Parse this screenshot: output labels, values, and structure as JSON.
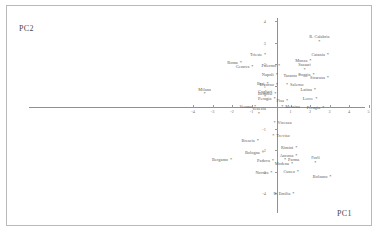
{
  "chart_data": {
    "type": "scatter",
    "title": "",
    "xlabel": "PC1",
    "ylabel": "PC2",
    "xlim": [
      -4.6,
      5.4
    ],
    "ylim": [
      -4.6,
      4.4
    ],
    "grid": false,
    "legend": "none",
    "marker": "*",
    "xticks": [
      -4,
      -3,
      -2,
      -1,
      1,
      2,
      3,
      4,
      5
    ],
    "yticks": [
      -4,
      -3,
      -2,
      -1,
      1,
      2,
      3,
      4
    ],
    "points": [
      {
        "label": "Milano",
        "x": -3.4,
        "y": 0.62,
        "pos": "above"
      },
      {
        "label": "Bergamo",
        "x": -2.05,
        "y": -2.45,
        "pos": "left"
      },
      {
        "label": "Roma",
        "x": -1.55,
        "y": 2.05,
        "pos": "left"
      },
      {
        "label": "Genova",
        "x": -0.95,
        "y": 1.9,
        "pos": "left"
      },
      {
        "label": "Trieste",
        "x": -0.3,
        "y": 2.45,
        "pos": "left"
      },
      {
        "label": "Palermo",
        "x": 0.42,
        "y": 1.92,
        "pos": "left"
      },
      {
        "label": "Napoli",
        "x": 0.3,
        "y": 1.52,
        "pos": "left"
      },
      {
        "label": "Verona",
        "x": -0.82,
        "y": 0.03,
        "pos": "left"
      },
      {
        "label": "Venezia",
        "x": -0.62,
        "y": -0.3,
        "pos": "above"
      },
      {
        "label": "Cagliari",
        "x": -0.3,
        "y": 0.5,
        "pos": "above"
      },
      {
        "label": "Brescia",
        "x": -0.68,
        "y": -1.55,
        "pos": "left"
      },
      {
        "label": "Bologna",
        "x": -0.42,
        "y": -2.12,
        "pos": "left"
      },
      {
        "label": "Padova",
        "x": 0.1,
        "y": -2.48,
        "pos": "left"
      },
      {
        "label": "Parma",
        "x": 0.72,
        "y": -2.45,
        "pos": "right"
      },
      {
        "label": "Messina",
        "x": 0.58,
        "y": 0.02,
        "pos": "right"
      },
      {
        "label": "Bari",
        "x": -0.18,
        "y": 1.1,
        "pos": "left"
      },
      {
        "label": "Livorno",
        "x": 0.3,
        "y": 1.05,
        "pos": "left"
      },
      {
        "label": "Salerno",
        "x": 0.82,
        "y": 1.02,
        "pos": "right"
      },
      {
        "label": "Brindisi",
        "x": 0.22,
        "y": 0.62,
        "pos": "left"
      },
      {
        "label": "Perugia",
        "x": 0.18,
        "y": 0.4,
        "pos": "left"
      },
      {
        "label": "Pisa",
        "x": 0.82,
        "y": 0.28,
        "pos": "left"
      },
      {
        "label": "Latina",
        "x": 2.25,
        "y": 0.82,
        "pos": "left"
      },
      {
        "label": "Lecce",
        "x": 2.32,
        "y": 0.38,
        "pos": "left"
      },
      {
        "label": "Foggia",
        "x": 2.18,
        "y": 1.5,
        "pos": "left"
      },
      {
        "label": "Siracusa",
        "x": 2.92,
        "y": 1.38,
        "pos": "left"
      },
      {
        "label": "Taranto",
        "x": 1.48,
        "y": 1.48,
        "pos": "left"
      },
      {
        "label": "Sassari",
        "x": 1.72,
        "y": 1.75,
        "pos": "above"
      },
      {
        "label": "Monza",
        "x": 2.02,
        "y": 2.18,
        "pos": "left"
      },
      {
        "label": "Catania",
        "x": 2.92,
        "y": 2.42,
        "pos": "left"
      },
      {
        "label": "R. Calabria",
        "x": 2.48,
        "y": 3.05,
        "pos": "above"
      },
      {
        "label": "Perugia",
        "x": 2.68,
        "y": -0.05,
        "pos": "left"
      },
      {
        "label": "Vicenza",
        "x": 0.18,
        "y": -0.72,
        "pos": "right"
      },
      {
        "label": "Treviso",
        "x": 0.12,
        "y": -1.32,
        "pos": "right"
      },
      {
        "label": "Rimini",
        "x": 1.3,
        "y": -1.88,
        "pos": "left"
      },
      {
        "label": "Ancona",
        "x": 1.3,
        "y": -2.25,
        "pos": "left"
      },
      {
        "label": "Modena",
        "x": 1.08,
        "y": -2.65,
        "pos": "left"
      },
      {
        "label": "Forlì",
        "x": 2.28,
        "y": -2.58,
        "pos": "above"
      },
      {
        "label": "Cuneo",
        "x": 1.38,
        "y": -3.02,
        "pos": "left"
      },
      {
        "label": "Novara",
        "x": 0.02,
        "y": -3.05,
        "pos": "left"
      },
      {
        "label": "Bolzano",
        "x": 3.05,
        "y": -3.22,
        "pos": "left"
      },
      {
        "label": "R. Emilia",
        "x": 1.15,
        "y": -4.05,
        "pos": "left"
      }
    ]
  }
}
